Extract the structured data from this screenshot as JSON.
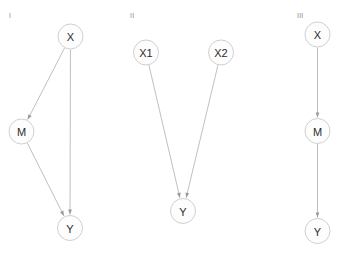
{
  "figure": {
    "title": "",
    "background_color": "#ffffff",
    "node_fill": "#fdfdfd",
    "node_stroke": "#c9c9c9",
    "edge_color": "#b9b9b9",
    "arrowhead_color": "#9a9a9a",
    "label_color": "#2b2b2b",
    "panel_label_color": "#8a8a8a",
    "node_radius": 12.5
  },
  "panels": [
    {
      "id": "panel-1",
      "label": "I",
      "label_x": 9,
      "label_y": 16,
      "nodes": [
        {
          "id": "X",
          "label": "X",
          "x": 70.5,
          "y": 36.5
        },
        {
          "id": "M",
          "label": "M",
          "x": 21.5,
          "y": 131.5
        },
        {
          "id": "Y",
          "label": "Y",
          "x": 70.0,
          "y": 228.0
        }
      ],
      "edges": [
        {
          "from": "X",
          "to": "M",
          "directed": true
        },
        {
          "from": "X",
          "to": "Y",
          "directed": true
        },
        {
          "from": "M",
          "to": "Y",
          "directed": true
        }
      ]
    },
    {
      "id": "panel-2",
      "label": "II",
      "label_x": 130,
      "label_y": 16,
      "nodes": [
        {
          "id": "X1",
          "label": "X1",
          "x": 146.0,
          "y": 52.5
        },
        {
          "id": "X2",
          "label": "X2",
          "x": 221.0,
          "y": 52.5
        },
        {
          "id": "Y",
          "label": "Y",
          "x": 183.0,
          "y": 211.0
        }
      ],
      "edges": [
        {
          "from": "X1",
          "to": "Y",
          "directed": true
        },
        {
          "from": "X2",
          "to": "Y",
          "directed": true
        }
      ]
    },
    {
      "id": "panel-3",
      "label": "III",
      "label_x": 297,
      "label_y": 16,
      "nodes": [
        {
          "id": "X",
          "label": "X",
          "x": 317.5,
          "y": 34.5
        },
        {
          "id": "M",
          "label": "M",
          "x": 317.5,
          "y": 131.0
        },
        {
          "id": "Y",
          "label": "Y",
          "x": 317.5,
          "y": 231.0
        }
      ],
      "edges": [
        {
          "from": "X",
          "to": "M",
          "directed": true
        },
        {
          "from": "M",
          "to": "Y",
          "directed": true
        }
      ]
    }
  ]
}
